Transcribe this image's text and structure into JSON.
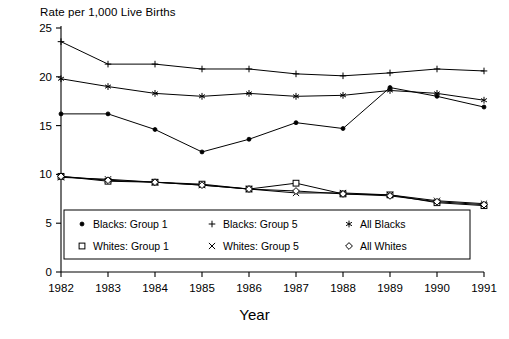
{
  "chart_data": {
    "type": "line",
    "title": "",
    "ylabel": "Rate per 1,000 Live Births",
    "xlabel": "Year",
    "categories": [
      "1982",
      "1983",
      "1984",
      "1985",
      "1986",
      "1987",
      "1988",
      "1989",
      "1990",
      "1991"
    ],
    "ylim": [
      0,
      25
    ],
    "yticks": [
      0,
      5,
      10,
      15,
      20,
      25
    ],
    "grid": false,
    "legend_position": "inside-bottom-left",
    "series": [
      {
        "name": "Blacks: Group 1",
        "marker": "filled-circle",
        "values": [
          16.2,
          16.2,
          14.6,
          12.3,
          13.6,
          15.3,
          14.7,
          18.9,
          18.0,
          16.9
        ]
      },
      {
        "name": "Blacks: Group 5",
        "marker": "plus",
        "values": [
          23.6,
          21.3,
          21.3,
          20.8,
          20.8,
          20.3,
          20.1,
          20.4,
          20.8,
          20.6
        ]
      },
      {
        "name": "All Blacks",
        "marker": "asterisk",
        "values": [
          19.8,
          19.0,
          18.3,
          18.0,
          18.3,
          18.0,
          18.1,
          18.6,
          18.3,
          17.6
        ]
      },
      {
        "name": "Whites: Group 1",
        "marker": "open-square",
        "values": [
          9.8,
          9.3,
          9.2,
          9.0,
          8.5,
          9.1,
          8.0,
          7.9,
          7.1,
          6.8
        ]
      },
      {
        "name": "Whites: Group 5",
        "marker": "x-cross",
        "values": [
          9.7,
          9.5,
          9.2,
          8.9,
          8.5,
          8.1,
          8.1,
          7.9,
          7.3,
          7.0
        ]
      },
      {
        "name": "All Whites",
        "marker": "open-diamond",
        "values": [
          9.8,
          9.4,
          9.2,
          8.9,
          8.5,
          8.3,
          8.0,
          7.8,
          7.2,
          6.9
        ]
      }
    ]
  },
  "legend": {
    "entries": [
      {
        "label": "Blacks: Group 1",
        "marker": "filled-circle"
      },
      {
        "label": "Blacks: Group 5",
        "marker": "plus"
      },
      {
        "label": "All Blacks",
        "marker": "asterisk"
      },
      {
        "label": "Whites: Group 1",
        "marker": "open-square"
      },
      {
        "label": "Whites: Group 5",
        "marker": "x-cross"
      },
      {
        "label": "All Whites",
        "marker": "open-diamond"
      }
    ]
  },
  "colors": {
    "line": "#000000",
    "axis": "#000000",
    "background": "#ffffff"
  }
}
